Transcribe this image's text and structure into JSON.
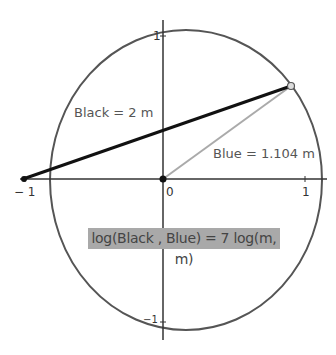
{
  "diagram": {
    "axes": {
      "x_ticks": [
        {
          "value": "-1",
          "label": "− 1"
        },
        {
          "value": "0",
          "label": "0"
        },
        {
          "value": "1",
          "label": "1"
        }
      ],
      "y_ticks": [
        {
          "value": "1",
          "label": "1"
        },
        {
          "value": "-1",
          "label": "−1"
        }
      ]
    },
    "labels": {
      "black": "Black = 2 m",
      "blue": "Blue = 1.104 m",
      "formula": "log(Black , Blue) = 7 log(m, m)"
    },
    "colors": {
      "circle": "#555555",
      "black_segment": "#111111",
      "blue_segment": "#aaaaaa",
      "axes": "#333333",
      "formula_bg": "#a9a9a9"
    }
  }
}
